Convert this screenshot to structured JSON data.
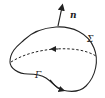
{
  "diagram": {
    "type": "surface-with-boundary",
    "labels": {
      "normal": "n",
      "surface": "Σ",
      "boundary": "Γ"
    },
    "colors": {
      "stroke": "#222222",
      "background": "#ffffff"
    }
  }
}
